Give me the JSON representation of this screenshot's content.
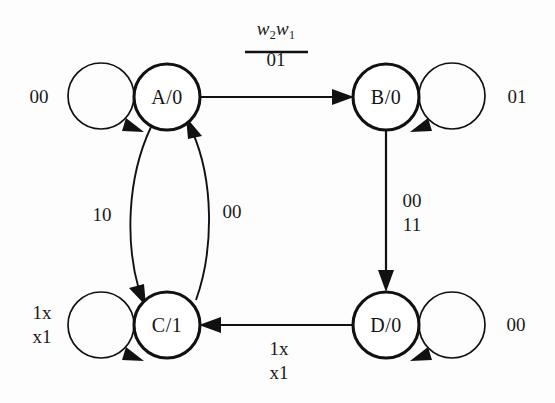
{
  "diagram": {
    "input_label": {
      "numerator": "w",
      "numerator_sub_2": "2",
      "numerator_w1": "w",
      "numerator_sub_1": "1",
      "denominator": "01"
    },
    "colors": {
      "stroke": "#111111",
      "background": "#fdfdfd",
      "text": "#1a1a1a"
    },
    "nodes": [
      {
        "id": "A",
        "label": "A/0",
        "state": "A",
        "output": "0",
        "cx": 167,
        "cy": 97
      },
      {
        "id": "B",
        "label": "B/0",
        "state": "B",
        "output": "0",
        "cx": 386,
        "cy": 97
      },
      {
        "id": "C",
        "label": "C/1",
        "state": "C",
        "output": "1",
        "cx": 167,
        "cy": 325
      },
      {
        "id": "D",
        "label": "D/0",
        "state": "D",
        "output": "0",
        "cx": 386,
        "cy": 325
      }
    ],
    "self_loops": [
      {
        "node": "A",
        "label": "00",
        "side": "left"
      },
      {
        "node": "B",
        "label": "01",
        "side": "right"
      },
      {
        "node": "C",
        "label": "1x\nx1",
        "label_line1": "1x",
        "label_line2": "x1",
        "side": "left"
      },
      {
        "node": "D",
        "label": "00",
        "side": "right"
      }
    ],
    "transitions": [
      {
        "from": "A",
        "to": "B",
        "label": "01",
        "shape": "straight-horizontal"
      },
      {
        "from": "A",
        "to": "C",
        "label": "10",
        "shape": "curve-left"
      },
      {
        "from": "C",
        "to": "A",
        "label": "00",
        "shape": "curve-right"
      },
      {
        "from": "B",
        "to": "D",
        "label_line1": "00",
        "label_line2": "11",
        "shape": "straight-vertical"
      },
      {
        "from": "D",
        "to": "C",
        "label_line1": "1x",
        "label_line2": "x1",
        "shape": "straight-horizontal"
      }
    ],
    "labels": {
      "loop_a": "00",
      "loop_b": "01",
      "loop_c_line1": "1x",
      "loop_c_line2": "x1",
      "loop_d": "00",
      "a_to_c": "10",
      "c_to_a": "00",
      "b_to_d_line1": "00",
      "b_to_d_line2": "11",
      "d_to_c_line1": "1x",
      "d_to_c_line2": "x1"
    }
  }
}
